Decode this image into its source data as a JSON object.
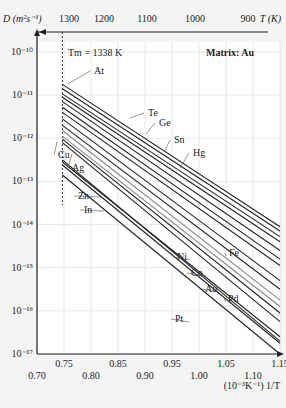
{
  "chart_data": {
    "type": "line",
    "title": "",
    "annotation_melting": "Tm = 1338 K",
    "annotation_matrix": "Matrix: Au",
    "ylabel": "D (m²s⁻¹)",
    "xlabel": "(10⁻³K⁻¹) 1/T",
    "top_xlabel": "T (K)",
    "ylog": true,
    "ylim": [
      1e-17,
      1e-10
    ],
    "xlim": [
      0.7,
      1.15
    ],
    "yticks": [
      "10⁻¹⁰",
      "10⁻¹¹",
      "10⁻¹²",
      "10⁻¹³",
      "10⁻¹⁴",
      "10⁻¹⁵",
      "10⁻¹⁶",
      "10⁻¹⁷"
    ],
    "xticks_upper": [
      "0.75",
      "0.85",
      "0.95",
      "1.05",
      "1.15"
    ],
    "xticks_lower": [
      "0.70",
      "0.80",
      "0.90",
      "1.00",
      "1.10"
    ],
    "top_ticks": [
      {
        "label": "1300",
        "x": 69
      },
      {
        "label": "1200",
        "x": 104
      },
      {
        "label": "1100",
        "x": 147
      },
      {
        "label": "1000",
        "x": 195
      },
      {
        "label": "900",
        "x": 248
      }
    ],
    "grid": true,
    "x_start": 0.747,
    "x_end": 1.15,
    "series": [
      {
        "name": "At",
        "log_start": -10.75,
        "log_end": -14.05
      },
      {
        "name": "Te",
        "log_start": -10.85,
        "log_end": -14.15
      },
      {
        "name": "Ge",
        "log_start": -10.97,
        "log_end": -14.28
      },
      {
        "name": "",
        "log_start": -11.05,
        "log_end": -14.4
      },
      {
        "name": "Sn",
        "log_start": -11.15,
        "log_end": -14.6
      },
      {
        "name": "Hg",
        "log_start": -11.28,
        "log_end": -14.8
      },
      {
        "name": "",
        "log_start": -11.4,
        "log_end": -14.95
      },
      {
        "name": "Fe",
        "log_start": -11.55,
        "log_end": -15.3
      },
      {
        "name": "Ni",
        "log_start": -11.7,
        "log_end": -15.5
      },
      {
        "name": "Co",
        "log_start": -11.82,
        "log_end": -15.75
      },
      {
        "name": "Au",
        "log_start": -11.95,
        "log_end": -15.9
      },
      {
        "name": "Cu",
        "log_start": -12.02,
        "log_end": -16.05
      },
      {
        "name": "Ag",
        "log_start": -12.1,
        "log_end": -16.25
      },
      {
        "name": "Pd",
        "log_start": -12.5,
        "log_end": -16.7
      },
      {
        "name": "Zn",
        "log_start": -12.55,
        "log_end": -16.6
      },
      {
        "name": "In",
        "log_start": -12.62,
        "log_end": -16.75
      },
      {
        "name": "Pt",
        "log_start": -12.85,
        "log_end": -17.0
      }
    ],
    "labels": [
      {
        "name": "At",
        "x": 94,
        "y": 74,
        "lx0": 68,
        "ly0": 84
      },
      {
        "name": "Te",
        "x": 148,
        "y": 116,
        "lx0": 130,
        "ly0": 118
      },
      {
        "name": "Ge",
        "x": 159,
        "y": 126,
        "lx0": 146,
        "ly0": 134
      },
      {
        "name": "Sn",
        "x": 174,
        "y": 143,
        "lx0": 164,
        "ly0": 152
      },
      {
        "name": "Hg",
        "x": 193,
        "y": 156,
        "lx0": 180,
        "ly0": 168
      },
      {
        "name": "Cu",
        "x": 58,
        "y": 158,
        "lx0": 57,
        "ly0": 142
      },
      {
        "name": "Ag",
        "x": 72,
        "y": 171,
        "lx0": 72,
        "ly0": 154
      },
      {
        "name": "Zn",
        "x": 78,
        "y": 199,
        "lx0": 100,
        "ly0": 197
      },
      {
        "name": "In",
        "x": 84,
        "y": 213,
        "lx0": 104,
        "ly0": 211
      },
      {
        "name": "Fe",
        "x": 229,
        "y": 256,
        "lx0": 226,
        "ly0": 256
      },
      {
        "name": "Ni",
        "x": 177,
        "y": 260,
        "lx0": 190,
        "ly0": 260
      },
      {
        "name": "Co",
        "x": 191,
        "y": 276,
        "lx0": 206,
        "ly0": 276
      },
      {
        "name": "Au",
        "x": 205,
        "y": 292,
        "lx0": 218,
        "ly0": 292
      },
      {
        "name": "Pd",
        "x": 228,
        "y": 302,
        "lx0": 226,
        "ly0": 302
      },
      {
        "name": "Pt",
        "x": 175,
        "y": 322,
        "lx0": 189,
        "ly0": 322
      }
    ]
  }
}
